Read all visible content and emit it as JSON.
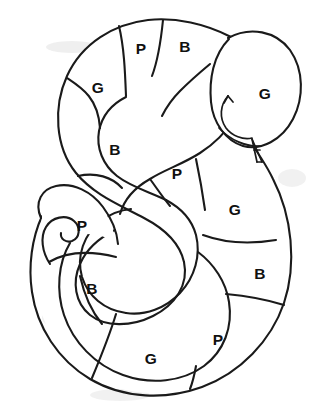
{
  "page": {
    "title_fragment": "",
    "background_color": "#ffffff",
    "ink_color": "#1a1a1a",
    "width": 315,
    "height": 413
  },
  "figure": {
    "name": "snake-coloring-puzzle",
    "style": "black-ink-line-art",
    "head": {
      "letter": "G",
      "eye_mark": "curled-arrow",
      "tongue": "forked-tongue"
    },
    "tail": {
      "shape": "spiral-curl"
    },
    "legend_letters": [
      "G",
      "P",
      "B"
    ],
    "segments": [
      {
        "id": "seg-1",
        "letter": "B",
        "x": 185,
        "y": 48,
        "region": "upper-arc-right"
      },
      {
        "id": "seg-2",
        "letter": "P",
        "x": 141,
        "y": 50,
        "region": "upper-arc-middle"
      },
      {
        "id": "seg-3",
        "letter": "G",
        "x": 98,
        "y": 89,
        "region": "upper-arc-left"
      },
      {
        "id": "seg-4",
        "letter": "B",
        "x": 115,
        "y": 151,
        "region": "upper-left-descending"
      },
      {
        "id": "seg-5",
        "letter": "P",
        "x": 177,
        "y": 175,
        "region": "middle-diagonal"
      },
      {
        "id": "seg-6",
        "letter": "G",
        "x": 235,
        "y": 211,
        "region": "right-upper"
      },
      {
        "id": "seg-7",
        "letter": "B",
        "x": 260,
        "y": 275,
        "region": "right-lower"
      },
      {
        "id": "seg-8",
        "letter": "P",
        "x": 218,
        "y": 341,
        "region": "bottom-right"
      },
      {
        "id": "seg-9",
        "letter": "G",
        "x": 151,
        "y": 360,
        "region": "bottom-middle"
      },
      {
        "id": "seg-10",
        "letter": "B",
        "x": 92,
        "y": 290,
        "region": "lower-left"
      },
      {
        "id": "seg-11",
        "letter": "P",
        "x": 82,
        "y": 227,
        "region": "tail-upper"
      }
    ],
    "letter_counts": {
      "G": 4,
      "P": 4,
      "B": 4
    }
  }
}
